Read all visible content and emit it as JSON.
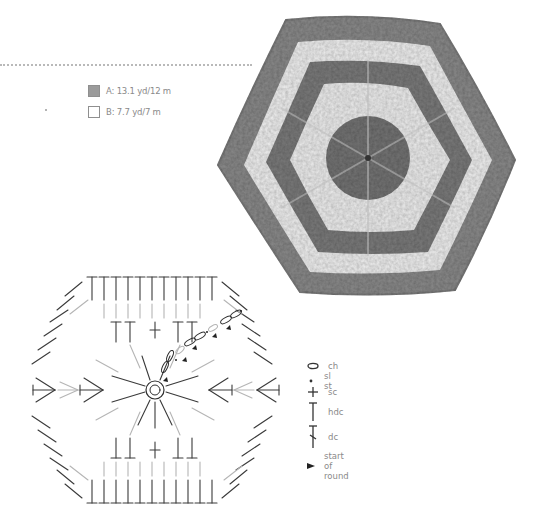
{
  "yarn_legend": {
    "items": [
      {
        "key": "A",
        "label": "A: 13.1 yd/12 m",
        "color": "#9b9b9b"
      },
      {
        "key": "B",
        "label": "B: 7.7 yd/7 m",
        "color": "#ffffff"
      }
    ]
  },
  "photo": {
    "subject": "crocheted hexagon motif",
    "colors": {
      "dark": "#7a7a7a",
      "light": "#f2f2f2",
      "edge": "#8c8c8c"
    },
    "rounds": [
      "A",
      "A",
      "B",
      "A",
      "B",
      "A"
    ]
  },
  "chart": {
    "colors": {
      "dark_rounds": "#3a3a3a",
      "light_rounds": "#b5b5b5"
    }
  },
  "symbol_legend": {
    "items": [
      {
        "symbol": "oval",
        "icon": "chain-icon",
        "label": "ch"
      },
      {
        "symbol": "dot",
        "icon": "slip-stitch-icon",
        "label": "sl st"
      },
      {
        "symbol": "plus",
        "icon": "single-crochet-icon",
        "label": "sc"
      },
      {
        "symbol": "T",
        "icon": "half-double-crochet-icon",
        "label": "hdc"
      },
      {
        "symbol": "T-slash",
        "icon": "double-crochet-icon",
        "label": "dc"
      },
      {
        "symbol": "triangle",
        "icon": "start-of-round-icon",
        "label": "start of round"
      }
    ]
  }
}
